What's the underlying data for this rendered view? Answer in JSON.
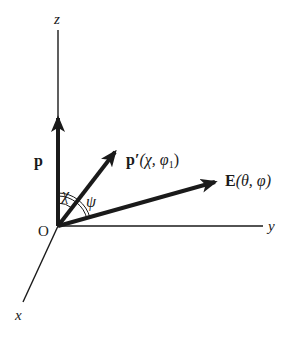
{
  "diagram": {
    "title": "",
    "origin": {
      "label": "O",
      "x": 58,
      "y": 226
    },
    "axes": [
      {
        "id": "z",
        "label": "z",
        "end": [
          58,
          30
        ],
        "label_pos": [
          55,
          24
        ]
      },
      {
        "id": "y",
        "label": "y",
        "end": [
          263,
          226
        ],
        "label_pos": [
          268,
          231
        ]
      },
      {
        "id": "x",
        "label": "x",
        "end": [
          23,
          302
        ],
        "label_pos": [
          15,
          320
        ]
      }
    ],
    "vectors": [
      {
        "id": "p",
        "label": "p",
        "end": [
          58,
          112
        ],
        "label_pos": [
          30,
          165
        ]
      },
      {
        "id": "p-prime",
        "label_main": "p′",
        "label_args": "(χ, φ",
        "label_sub": "1",
        "label_close": ")",
        "end": [
          119,
          147
        ],
        "label_pos": [
          127,
          165
        ]
      },
      {
        "id": "E",
        "label_main": "E",
        "label_args": "(θ, φ)",
        "end": [
          222,
          180
        ],
        "label_pos": [
          224,
          186
        ]
      }
    ],
    "angles": [
      {
        "id": "chi",
        "label": "χ",
        "between": [
          "p",
          "p-prime"
        ],
        "label_pos": [
          64,
          200
        ]
      },
      {
        "id": "psi",
        "label": "ψ",
        "between": [
          "p",
          "E"
        ],
        "label_pos": [
          88,
          207
        ],
        "double_arc": true
      }
    ],
    "colors": {
      "stroke": "#1a1a1a",
      "background": "#ffffff"
    }
  }
}
